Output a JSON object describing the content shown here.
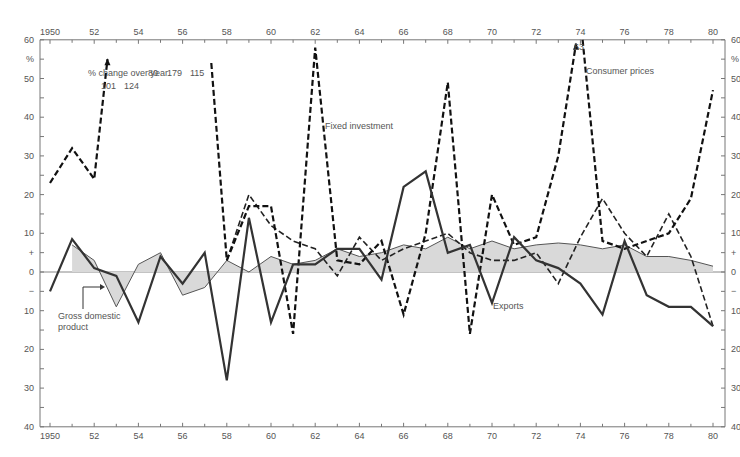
{
  "chart_data": {
    "type": "line",
    "title": "",
    "subtitle": "% change over year",
    "xlabel": "",
    "ylabel": "%",
    "x_range": [
      1950,
      1980
    ],
    "ylim": [
      -40,
      60
    ],
    "grid": false,
    "x_ticks_labels": [
      "1950",
      "52",
      "54",
      "56",
      "58",
      "60",
      "62",
      "64",
      "66",
      "68",
      "70",
      "72",
      "74",
      "76",
      "78",
      "80"
    ],
    "y_ticks_labels": [
      "60",
      "%",
      "50",
      "40",
      "30",
      "20",
      "10",
      "+",
      "0",
      "−",
      "10",
      "20",
      "30",
      "40"
    ],
    "x": [
      1950,
      1951,
      1952,
      1953,
      1954,
      1955,
      1956,
      1957,
      1958,
      1959,
      1960,
      1961,
      1962,
      1963,
      1964,
      1965,
      1966,
      1967,
      1968,
      1969,
      1970,
      1971,
      1972,
      1973,
      1974,
      1975,
      1976,
      1977,
      1978,
      1979,
      1980
    ],
    "series": [
      {
        "name": "Gross domestic product",
        "style": "thin solid line, shaded area to zero",
        "x": [
          1951,
          1952,
          1953,
          1954,
          1955,
          1956,
          1957,
          1958,
          1959,
          1960,
          1961,
          1962,
          1963,
          1964,
          1965,
          1966,
          1967,
          1968,
          1969,
          1970,
          1971,
          1972,
          1973,
          1974,
          1975,
          1976,
          1977,
          1978,
          1979,
          1980
        ],
        "values": [
          7,
          3,
          -9,
          2,
          5,
          -6,
          -4,
          3,
          0,
          4,
          2,
          3,
          6,
          4,
          5,
          7,
          6,
          9,
          6,
          8,
          6,
          7,
          7.5,
          7,
          6,
          7,
          4,
          4,
          3,
          1.5
        ]
      },
      {
        "name": "Exports",
        "style": "thick solid line",
        "x": [
          1950,
          1951,
          1952,
          1953,
          1954,
          1955,
          1956,
          1957,
          1958,
          1959,
          1960,
          1961,
          1962,
          1963,
          1964,
          1965,
          1966,
          1967,
          1968,
          1969,
          1970,
          1971,
          1972,
          1973,
          1974,
          1975,
          1976,
          1977,
          1978,
          1979,
          1980
        ],
        "values": [
          -5,
          8.5,
          1,
          -1,
          -13,
          4,
          -3,
          5,
          -28,
          14,
          -13,
          2,
          2,
          6,
          6,
          -2,
          22,
          26,
          5,
          7,
          -8,
          9,
          3,
          1,
          -3,
          -11,
          8,
          -6,
          -9,
          -9,
          -14
        ]
      },
      {
        "name": "Fixed investment",
        "style": "dashed line (lighter)",
        "x": [
          1958,
          1959,
          1960,
          1961,
          1962,
          1963,
          1964,
          1965,
          1966,
          1967,
          1968,
          1969,
          1970,
          1971,
          1972,
          1973,
          1974,
          1975,
          1976,
          1977,
          1978,
          1979,
          1980
        ],
        "values": [
          3,
          20,
          12,
          8,
          6,
          -1,
          9,
          3,
          6,
          8,
          10,
          5,
          3,
          3,
          5,
          -3,
          9,
          19,
          10,
          4,
          15,
          4,
          -14
        ]
      },
      {
        "name": "Consumer prices",
        "style": "heavy dashed line",
        "x": [
          1950,
          1951,
          1952,
          1953,
          1957,
          1958,
          1959,
          1960,
          1961,
          1962,
          1963,
          1964,
          1965,
          1966,
          1967,
          1968,
          1969,
          1970,
          1971,
          1972,
          1973,
          1974,
          1975,
          1976,
          1977,
          1978,
          1979,
          1980
        ],
        "values": [
          23,
          32,
          24,
          101,
          115,
          3,
          17,
          17,
          -16,
          58,
          3,
          2,
          8,
          -11,
          10,
          49,
          -16,
          20,
          7,
          9,
          30,
          63,
          8,
          6,
          8,
          10,
          19,
          47
        ],
        "annotations": [
          {
            "year": 1953,
            "label": "101",
            "note": "off scale, arrow"
          },
          {
            "year": 1954,
            "label": "124",
            "note": "off scale"
          },
          {
            "year": 1955,
            "label": "80",
            "note": "off scale"
          },
          {
            "year": 1956,
            "label": "179",
            "note": "off scale"
          },
          {
            "year": 1957,
            "label": "115",
            "note": "off scale"
          },
          {
            "year": 1974,
            "label": "63",
            "note": "arrow"
          }
        ]
      }
    ],
    "legend": "inline labels",
    "labels": {
      "gdp": [
        "Gross domestic",
        "product"
      ],
      "exports": "Exports",
      "fixed_investment": "Fixed investment",
      "consumer_prices": "Consumer prices"
    }
  },
  "top_annotations": {
    "subtitle": "% change over year",
    "offscale": [
      "101",
      "124",
      "80",
      "179",
      "115"
    ],
    "peak_74": "63"
  },
  "colors": {
    "axis": "#777777",
    "text": "#555555",
    "line_dark": "#333333",
    "dash_dark": "#111111",
    "area_fill": "#d9d9d9"
  }
}
